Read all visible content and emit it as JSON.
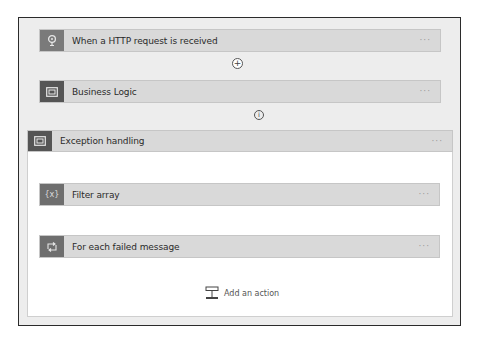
{
  "canvas": {
    "frame_bg": "#ededed",
    "card_bg": "#d9d9d9",
    "icon_bg_trigger": "#7a7a7a",
    "icon_bg_scope": "#555555",
    "icon_bg_action": "#6e6e6e"
  },
  "flow": {
    "trigger": {
      "label": "When a HTTP request is received",
      "icon": "request-icon",
      "more": "···"
    },
    "connector_1": {
      "icon": "add-circle-icon",
      "symbol": "+"
    },
    "business_logic": {
      "label": "Business Logic",
      "icon": "scope-icon",
      "more": "···"
    },
    "connector_2": {
      "icon": "info-circle-icon",
      "symbol": "i",
      "style": "dashed"
    },
    "exception_scope": {
      "label": "Exception handling",
      "icon": "scope-icon",
      "more": "···",
      "actions": [
        {
          "label": "Filter array",
          "icon": "filter-array-icon",
          "glyph": "{x}",
          "more": "···"
        },
        {
          "label": "For each failed message",
          "icon": "foreach-loop-icon",
          "more": "···"
        }
      ],
      "add_action": {
        "label": "Add an action",
        "icon": "add-action-icon"
      }
    }
  }
}
